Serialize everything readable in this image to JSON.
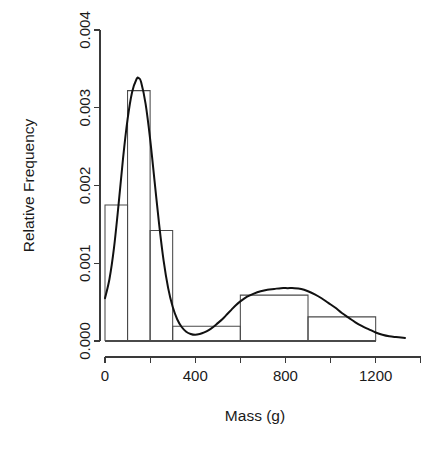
{
  "chart_data": {
    "type": "bar",
    "title": "",
    "subtitle": "",
    "xlabel": "Mass (g)",
    "ylabel": "Relative Frequency",
    "xlim": [
      0,
      1330
    ],
    "ylim": [
      0,
      0.004
    ],
    "grid": false,
    "legend": null,
    "x_ticks": [
      {
        "value": 0,
        "label": "0"
      },
      {
        "value": 200,
        "label": ""
      },
      {
        "value": 400,
        "label": "400"
      },
      {
        "value": 600,
        "label": ""
      },
      {
        "value": 800,
        "label": "800"
      },
      {
        "value": 1000,
        "label": ""
      },
      {
        "value": 1200,
        "label": "1200"
      }
    ],
    "y_ticks": [
      {
        "value": 0.0,
        "label": "0.000"
      },
      {
        "value": 0.001,
        "label": "0.001"
      },
      {
        "value": 0.002,
        "label": "0.002"
      },
      {
        "value": 0.003,
        "label": "0.003"
      },
      {
        "value": 0.004,
        "label": "0.004"
      }
    ],
    "bins": [
      {
        "start": 0,
        "end": 100,
        "density": 0.00175
      },
      {
        "start": 100,
        "end": 200,
        "density": 0.00322
      },
      {
        "start": 200,
        "end": 300,
        "density": 0.00142
      },
      {
        "start": 300,
        "end": 600,
        "density": 0.00019
      },
      {
        "start": 600,
        "end": 900,
        "density": 0.00059
      },
      {
        "start": 900,
        "end": 1200,
        "density": 0.00031
      }
    ],
    "density_curve": {
      "name": "kernel density estimate",
      "peaks": [
        {
          "x": 150,
          "y": 0.00338
        },
        {
          "x": 840,
          "y": 0.00068
        }
      ],
      "points": [
        [
          0,
          0.00055
        ],
        [
          20,
          0.0008
        ],
        [
          40,
          0.0012
        ],
        [
          60,
          0.00175
        ],
        [
          80,
          0.00235
        ],
        [
          100,
          0.00285
        ],
        [
          120,
          0.0032
        ],
        [
          140,
          0.00337
        ],
        [
          150,
          0.00338
        ],
        [
          160,
          0.00333
        ],
        [
          180,
          0.00305
        ],
        [
          200,
          0.0026
        ],
        [
          220,
          0.00205
        ],
        [
          240,
          0.0015
        ],
        [
          260,
          0.00103
        ],
        [
          280,
          0.00068
        ],
        [
          300,
          0.00044
        ],
        [
          320,
          0.00028
        ],
        [
          340,
          0.00018
        ],
        [
          360,
          0.00012
        ],
        [
          380,
          9e-05
        ],
        [
          400,
          8e-05
        ],
        [
          420,
          9e-05
        ],
        [
          440,
          0.00011
        ],
        [
          460,
          0.00014
        ],
        [
          480,
          0.00018
        ],
        [
          500,
          0.00023
        ],
        [
          520,
          0.00028
        ],
        [
          540,
          0.00034
        ],
        [
          560,
          0.0004
        ],
        [
          580,
          0.00046
        ],
        [
          600,
          0.00051
        ],
        [
          630,
          0.00057
        ],
        [
          660,
          0.00061
        ],
        [
          690,
          0.00064
        ],
        [
          720,
          0.00066
        ],
        [
          750,
          0.00067
        ],
        [
          780,
          0.00068
        ],
        [
          810,
          0.00068
        ],
        [
          840,
          0.00068
        ],
        [
          870,
          0.00067
        ],
        [
          900,
          0.00064
        ],
        [
          930,
          0.0006
        ],
        [
          960,
          0.00055
        ],
        [
          990,
          0.00049
        ],
        [
          1020,
          0.00043
        ],
        [
          1050,
          0.00036
        ],
        [
          1080,
          0.0003
        ],
        [
          1110,
          0.00024
        ],
        [
          1140,
          0.00019
        ],
        [
          1170,
          0.00015
        ],
        [
          1200,
          0.00011
        ],
        [
          1230,
          8e-05
        ],
        [
          1260,
          6e-05
        ],
        [
          1290,
          5e-05
        ],
        [
          1330,
          4e-05
        ]
      ]
    }
  },
  "colors": {
    "background": "#ffffff",
    "axis": "#3a3a3a",
    "bar_stroke": "#4a4a4a",
    "curve": "#111111",
    "text": "#1a1a1a"
  }
}
